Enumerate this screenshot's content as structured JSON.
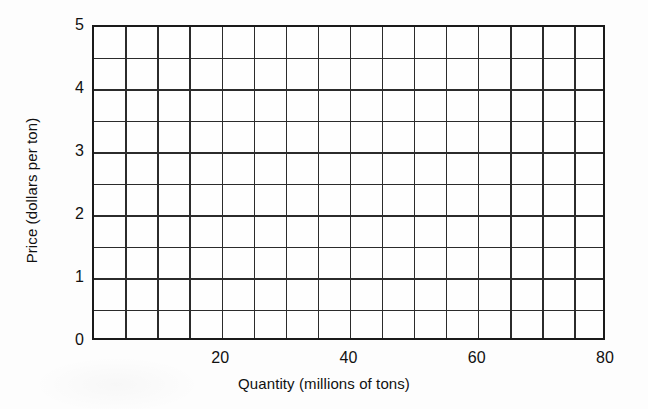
{
  "chart_data": {
    "type": "line",
    "title": "",
    "subtitle": "",
    "xlabel": "Quantity (millions of tons)",
    "ylabel": "Price (dollars per ton)",
    "xlim": [
      0,
      80
    ],
    "ylim": [
      0,
      5
    ],
    "grid": true,
    "legend": null,
    "series": [],
    "x_major_ticks": [
      20,
      40,
      60,
      80
    ],
    "x_major_tick_labels": [
      "20",
      "40",
      "60",
      "80"
    ],
    "x_gridline_values": [
      0,
      5,
      10,
      15,
      20,
      25,
      30,
      35,
      40,
      45,
      50,
      55,
      60,
      65,
      70,
      75,
      80
    ],
    "x_gridline_step": 5,
    "y_major_ticks": [
      0,
      1,
      2,
      3,
      4,
      5
    ],
    "y_major_tick_labels": [
      "0",
      "1",
      "2",
      "3",
      "4",
      "5"
    ],
    "y_gridline_values": [
      0,
      0.5,
      1,
      1.5,
      2,
      2.5,
      3,
      3.5,
      4,
      4.5,
      5
    ],
    "y_gridline_step": 0.5,
    "annotations": []
  },
  "colors": {
    "background": "#fdfdfd",
    "plot_background": "#fefefe",
    "frame": "#1a1a1a",
    "gridline": "#2b2b2b",
    "text": "#111111"
  }
}
